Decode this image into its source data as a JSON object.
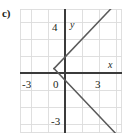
{
  "figure": {
    "part_label": "c)",
    "background_color": "#ffffff",
    "grid_color": "#dcdcdc",
    "axis_color": "#3b3b3b",
    "curve_color": "#555555",
    "text_color": "#231f20"
  },
  "labels": {
    "y_axis": "y",
    "x_axis": "x",
    "y_positive_tick": "4",
    "y_negative_tick": "-3",
    "x_negative_tick": "-3",
    "x_positive_tick": "3",
    "origin": "0"
  },
  "chart_data": {
    "type": "line",
    "title": "",
    "xlabel": "x",
    "ylabel": "y",
    "xlim": [
      -4,
      5
    ],
    "ylim": [
      -4.4,
      6
    ],
    "grid": true,
    "grid_step": 1,
    "legend": null,
    "axis_ticks": {
      "x_labeled": [
        -3,
        0,
        3
      ],
      "y_labeled": [
        4,
        -3
      ]
    },
    "vertex": [
      -1,
      1
    ],
    "series": [
      {
        "name": "upper-ray",
        "points": [
          [
            -1,
            1
          ],
          [
            5,
            7
          ]
        ]
      },
      {
        "name": "lower-ray",
        "points": [
          [
            -1,
            1
          ],
          [
            5,
            -5
          ]
        ]
      }
    ]
  }
}
